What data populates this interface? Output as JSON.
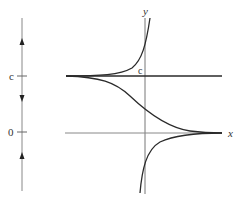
{
  "figure": {
    "phase_line": {
      "labels": {
        "upper_equilibrium": "c",
        "lower_equilibrium": "0"
      },
      "arrows": [
        "up",
        "down",
        "up"
      ]
    },
    "graph": {
      "x_axis_label": "x",
      "y_axis_label": "y",
      "equilibrium_label": "c"
    },
    "colors": {
      "axis": "#777777",
      "curve": "#2a2a2a",
      "text": "#333333"
    }
  }
}
